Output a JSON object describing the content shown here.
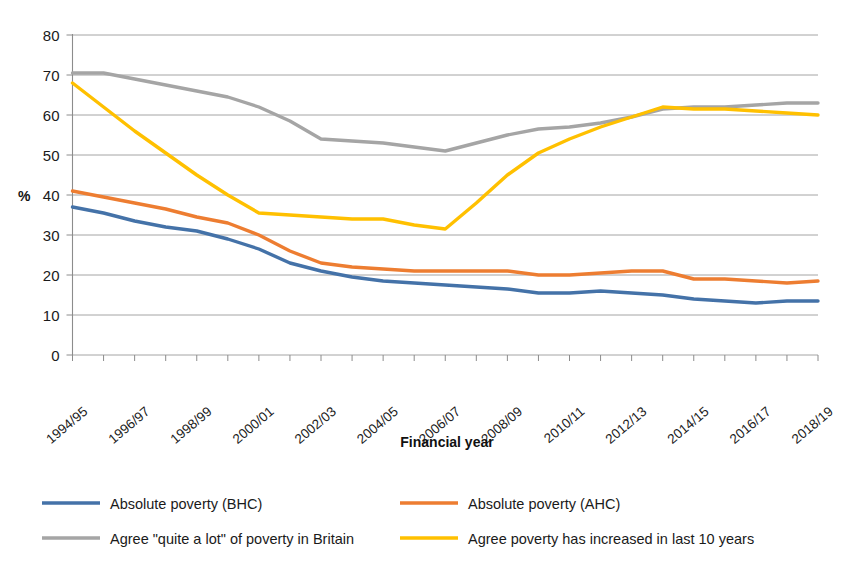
{
  "chart_data": {
    "type": "line",
    "title": "",
    "xlabel": "Financial year",
    "ylabel": "%",
    "ylim": [
      0,
      80
    ],
    "ytick_values": [
      0,
      10,
      20,
      30,
      40,
      50,
      60,
      70,
      80
    ],
    "ytick_labels": [
      "0",
      "10",
      "20",
      "30",
      "40",
      "50",
      "60",
      "70",
      "80"
    ],
    "grid": true,
    "legend_position": "bottom",
    "x": [
      "1994/95",
      "1995/96",
      "1996/97",
      "1997/98",
      "1998/99",
      "1999/00",
      "2000/01",
      "2001/02",
      "2002/03",
      "2003/04",
      "2004/05",
      "2005/06",
      "2006/07",
      "2007/08",
      "2008/09",
      "2009/10",
      "2010/11",
      "2011/12",
      "2012/13",
      "2013/14",
      "2014/15",
      "2015/16",
      "2016/17",
      "2017/18",
      "2018/19"
    ],
    "xtick_labels": [
      "1994/95",
      "1996/97",
      "1998/99",
      "2000/01",
      "2002/03",
      "2004/05",
      "2006/07",
      "2008/09",
      "2010/11",
      "2012/13",
      "2014/15",
      "2016/17",
      "2018/19"
    ],
    "series": [
      {
        "name": "Absolute poverty (BHC)",
        "color": "#4472a8",
        "values": [
          37,
          35.5,
          33.5,
          32,
          31,
          29,
          26.5,
          23,
          21,
          19.5,
          18.5,
          18,
          17.5,
          17,
          16.5,
          15.5,
          15.5,
          16,
          15.5,
          15,
          14,
          13.5,
          13,
          13.5,
          13.5
        ]
      },
      {
        "name": "Absolute poverty (AHC)",
        "color": "#ed7d31",
        "values": [
          41,
          39.5,
          38,
          36.5,
          34.5,
          33,
          30,
          26,
          23,
          22,
          21.5,
          21,
          21,
          21,
          21,
          20,
          20,
          20.5,
          21,
          21,
          19,
          19,
          18.5,
          18,
          18.5
        ]
      },
      {
        "name": "Agree \"quite a lot\" of poverty in Britain",
        "color": "#a5a5a5",
        "values": [
          70.5,
          70.5,
          69,
          67.5,
          66,
          64.5,
          62,
          58.5,
          54,
          53.5,
          53,
          52,
          51,
          53,
          55,
          56.5,
          57,
          58,
          59.5,
          61.5,
          62,
          62,
          62.5,
          63,
          63
        ]
      },
      {
        "name": "Agree poverty has increased in last 10 years",
        "color": "#ffc000",
        "values": [
          68,
          62,
          56,
          50.5,
          45,
          40,
          35.5,
          35,
          34.5,
          34,
          34,
          32.5,
          31.5,
          38,
          45,
          50.5,
          54,
          57,
          59.5,
          62,
          61.5,
          61.5,
          61,
          60.5,
          60
        ]
      }
    ]
  },
  "legend": {
    "entries": [
      {
        "label": "Absolute poverty (BHC)",
        "color": "#4472a8"
      },
      {
        "label": "Absolute poverty (AHC)",
        "color": "#ed7d31"
      },
      {
        "label": "Agree \"quite a lot\" of poverty in Britain",
        "color": "#a5a5a5"
      },
      {
        "label": "Agree poverty has increased in last 10 years",
        "color": "#ffc000"
      }
    ]
  }
}
